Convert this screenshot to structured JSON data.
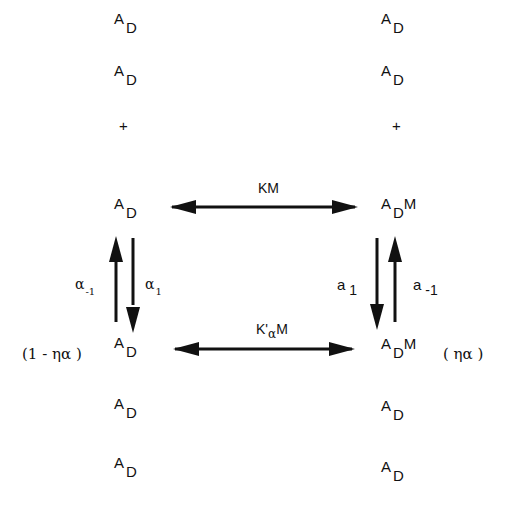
{
  "left_column": {
    "species": [
      {
        "base": "A",
        "sub": "D",
        "suffix": ""
      },
      {
        "base": "A",
        "sub": "D",
        "suffix": ""
      },
      {
        "base": "A",
        "sub": "D",
        "suffix": ""
      },
      {
        "base": "A",
        "sub": "D",
        "suffix": ""
      },
      {
        "base": "A",
        "sub": "D",
        "suffix": ""
      },
      {
        "base": "A",
        "sub": "D",
        "suffix": ""
      }
    ],
    "plus": "+",
    "fraction_label": "(1 - ηα )"
  },
  "right_column": {
    "species": [
      {
        "base": "A",
        "sub": "D",
        "suffix": ""
      },
      {
        "base": "A",
        "sub": "D",
        "suffix": ""
      },
      {
        "base": "A",
        "sub": "D",
        "suffix": "M"
      },
      {
        "base": "A",
        "sub": "D",
        "suffix": "M"
      },
      {
        "base": "A",
        "sub": "D",
        "suffix": ""
      },
      {
        "base": "A",
        "sub": "D",
        "suffix": ""
      }
    ],
    "plus": "+",
    "fraction_label": "( ηα )"
  },
  "top_arrow": {
    "label": "KM"
  },
  "bottom_arrow": {
    "label_base": "K'",
    "label_sub": "α",
    "label_suffix": "M"
  },
  "left_vertical": {
    "up_label": "α",
    "up_sub": "-1",
    "down_label": "α",
    "down_sub": "1"
  },
  "right_vertical": {
    "down_label": "a",
    "down_sub": "1",
    "up_label": "a",
    "up_sub": "-1"
  }
}
